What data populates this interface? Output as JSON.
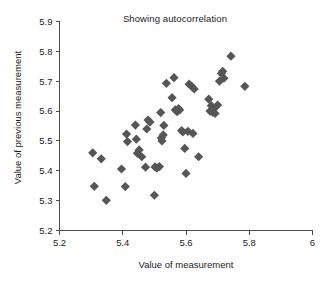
{
  "chart_data": {
    "type": "scatter",
    "title": "Showing autocorrelation",
    "xlabel": "Value of measurement",
    "ylabel": "Value of previous measurement",
    "xlim": [
      5.2,
      6.0
    ],
    "ylim": [
      5.2,
      5.9
    ],
    "xticks": [
      5.2,
      5.4,
      5.6,
      5.8,
      6
    ],
    "yticks": [
      5.2,
      5.3,
      5.4,
      5.5,
      5.6,
      5.7,
      5.8,
      5.9
    ],
    "xtick_labels": [
      "5.2",
      "5.4",
      "5.6",
      "5.8",
      "6"
    ],
    "ytick_labels": [
      "5.2",
      "5.3",
      "5.4",
      "5.5",
      "5.6",
      "5.7",
      "5.8",
      "5.9"
    ],
    "grid": false,
    "legend": null,
    "marker": "diamond",
    "marker_color": "#565656",
    "series": [
      {
        "name": "measurements",
        "points": [
          [
            5.305,
            5.46
          ],
          [
            5.31,
            5.348
          ],
          [
            5.332,
            5.44
          ],
          [
            5.348,
            5.301
          ],
          [
            5.396,
            5.406
          ],
          [
            5.408,
            5.347
          ],
          [
            5.412,
            5.523
          ],
          [
            5.415,
            5.498
          ],
          [
            5.44,
            5.553
          ],
          [
            5.443,
            5.506
          ],
          [
            5.446,
            5.459
          ],
          [
            5.452,
            5.47
          ],
          [
            5.46,
            5.447
          ],
          [
            5.472,
            5.412
          ],
          [
            5.476,
            5.54
          ],
          [
            5.48,
            5.57
          ],
          [
            5.486,
            5.563
          ],
          [
            5.5,
            5.318
          ],
          [
            5.502,
            5.413
          ],
          [
            5.508,
            5.409
          ],
          [
            5.516,
            5.414
          ],
          [
            5.52,
            5.595
          ],
          [
            5.522,
            5.51
          ],
          [
            5.524,
            5.5
          ],
          [
            5.528,
            5.52
          ],
          [
            5.53,
            5.552
          ],
          [
            5.538,
            5.693
          ],
          [
            5.556,
            5.645
          ],
          [
            5.562,
            5.712
          ],
          [
            5.566,
            5.604
          ],
          [
            5.572,
            5.598
          ],
          [
            5.576,
            5.608
          ],
          [
            5.58,
            5.604
          ],
          [
            5.586,
            5.535
          ],
          [
            5.59,
            5.53
          ],
          [
            5.596,
            5.475
          ],
          [
            5.6,
            5.391
          ],
          [
            5.606,
            5.532
          ],
          [
            5.61,
            5.69
          ],
          [
            5.618,
            5.683
          ],
          [
            5.622,
            5.525
          ],
          [
            5.626,
            5.674
          ],
          [
            5.64,
            5.447
          ],
          [
            5.672,
            5.64
          ],
          [
            5.676,
            5.6
          ],
          [
            5.68,
            5.618
          ],
          [
            5.684,
            5.596
          ],
          [
            5.688,
            5.608
          ],
          [
            5.692,
            5.592
          ],
          [
            5.7,
            5.62
          ],
          [
            5.706,
            5.7
          ],
          [
            5.712,
            5.726
          ],
          [
            5.716,
            5.733
          ],
          [
            5.72,
            5.71
          ],
          [
            5.742,
            5.784
          ],
          [
            5.786,
            5.683
          ]
        ]
      }
    ]
  }
}
